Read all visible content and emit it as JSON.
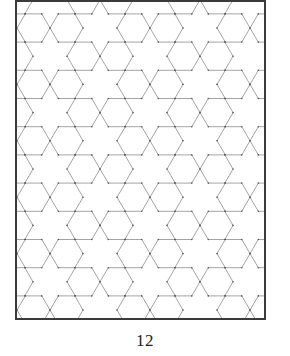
{
  "page": {
    "number": "12"
  },
  "figure": {
    "frame": {
      "x": 16,
      "y": 1,
      "width": 249,
      "height": 318,
      "stroke": "#3a3a3a",
      "stroke_width": 2
    },
    "line_color": "#9a9a9a",
    "vertex_dot_color": "#555555",
    "hexagon": {
      "orientation": "flat-top",
      "radius": 16.5,
      "row_pitch": 28.2,
      "first_row_center_y": 28,
      "rows_from": -1,
      "rows_to": 11,
      "even_row_centers_x": [
        33.5,
        66.5,
        133.5,
        166.5,
        233.5,
        266.5
      ],
      "odd_row_centers_x": [
        -16.5,
        16.5,
        83.5,
        116.5,
        183.5,
        216.5,
        283.5
      ]
    }
  }
}
